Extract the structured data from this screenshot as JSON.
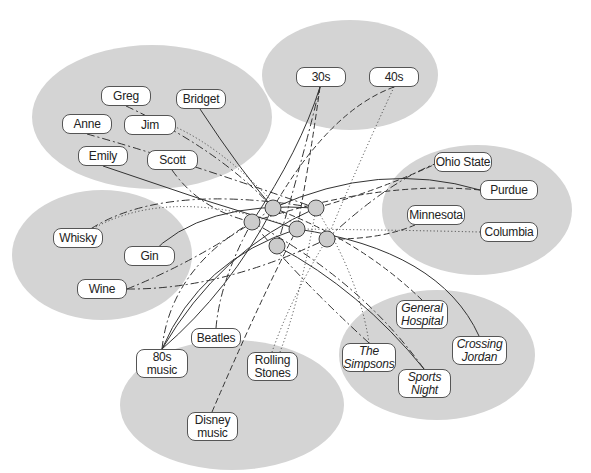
{
  "diagram": {
    "type": "affiliation network",
    "colors": {
      "cluster": "#d4d4d4",
      "node_fill": "#ffffff",
      "node_border": "#555555",
      "hub": "#cccccc",
      "line": "#333333"
    },
    "clusters": [
      {
        "id": "people",
        "cx": 152,
        "cy": 117,
        "rx": 120,
        "ry": 72
      },
      {
        "id": "decades",
        "cx": 350,
        "cy": 75,
        "rx": 88,
        "ry": 55
      },
      {
        "id": "schools",
        "cx": 477,
        "cy": 210,
        "rx": 95,
        "ry": 65
      },
      {
        "id": "drinks",
        "cx": 102,
        "cy": 255,
        "rx": 90,
        "ry": 65
      },
      {
        "id": "tv_shows",
        "cx": 437,
        "cy": 355,
        "rx": 98,
        "ry": 65
      },
      {
        "id": "music",
        "cx": 232,
        "cy": 405,
        "rx": 112,
        "ry": 65
      }
    ],
    "nodes": [
      {
        "id": "greg",
        "label": "Greg",
        "x": 101,
        "y": 86,
        "w": 50,
        "h": 20,
        "italic": false
      },
      {
        "id": "bridget",
        "label": "Bridget",
        "x": 176,
        "y": 89,
        "w": 50,
        "h": 20,
        "italic": false
      },
      {
        "id": "anne",
        "label": "Anne",
        "x": 62,
        "y": 114,
        "w": 50,
        "h": 20,
        "italic": false
      },
      {
        "id": "jim",
        "label": "Jim",
        "x": 124,
        "y": 115,
        "w": 52,
        "h": 20,
        "italic": false
      },
      {
        "id": "emily",
        "label": "Emily",
        "x": 78,
        "y": 146,
        "w": 50,
        "h": 20,
        "italic": false
      },
      {
        "id": "scott",
        "label": "Scott",
        "x": 147,
        "y": 150,
        "w": 51,
        "h": 20,
        "italic": false
      },
      {
        "id": "s30",
        "label": "30s",
        "x": 296,
        "y": 67,
        "w": 50,
        "h": 20,
        "italic": false
      },
      {
        "id": "s40",
        "label": "40s",
        "x": 369,
        "y": 67,
        "w": 50,
        "h": 20,
        "italic": false
      },
      {
        "id": "ohio",
        "label": "Ohio State",
        "x": 434,
        "y": 152,
        "w": 58,
        "h": 20,
        "italic": false
      },
      {
        "id": "purdue",
        "label": "Purdue",
        "x": 480,
        "y": 180,
        "w": 58,
        "h": 20,
        "italic": false
      },
      {
        "id": "minnesota",
        "label": "Minnesota",
        "x": 407,
        "y": 205,
        "w": 58,
        "h": 20,
        "italic": false
      },
      {
        "id": "columbia",
        "label": "Columbia",
        "x": 480,
        "y": 222,
        "w": 58,
        "h": 20,
        "italic": false
      },
      {
        "id": "whisky",
        "label": "Whisky",
        "x": 53,
        "y": 228,
        "w": 50,
        "h": 20,
        "italic": false
      },
      {
        "id": "gin",
        "label": "Gin",
        "x": 124,
        "y": 246,
        "w": 51,
        "h": 20,
        "italic": false
      },
      {
        "id": "wine",
        "label": "Wine",
        "x": 77,
        "y": 279,
        "w": 50,
        "h": 20,
        "italic": false
      },
      {
        "id": "general_hospital",
        "label": "General\nHospital",
        "x": 396,
        "y": 300,
        "w": 52,
        "h": 29,
        "italic": true
      },
      {
        "id": "simpsons",
        "label": "The\nSimpsons",
        "x": 342,
        "y": 343,
        "w": 54,
        "h": 29,
        "italic": true
      },
      {
        "id": "crossing_jordan",
        "label": "Crossing\nJordan",
        "x": 452,
        "y": 336,
        "w": 55,
        "h": 29,
        "italic": true
      },
      {
        "id": "sports_night",
        "label": "Sports\nNight",
        "x": 398,
        "y": 369,
        "w": 53,
        "h": 29,
        "italic": true
      },
      {
        "id": "beatles",
        "label": "Beatles",
        "x": 191,
        "y": 328,
        "w": 50,
        "h": 20,
        "italic": false
      },
      {
        "id": "s80s_music",
        "label": "80s\nmusic",
        "x": 136,
        "y": 349,
        "w": 52,
        "h": 29,
        "italic": false
      },
      {
        "id": "rolling_stones",
        "label": "Rolling\nStones",
        "x": 247,
        "y": 352,
        "w": 51,
        "h": 29,
        "italic": false
      },
      {
        "id": "disney_music",
        "label": "Disney\nmusic",
        "x": 187,
        "y": 412,
        "w": 51,
        "h": 29,
        "italic": false
      }
    ],
    "hubs": [
      {
        "id": "h1",
        "cx": 273,
        "cy": 208,
        "r": 8
      },
      {
        "id": "h2",
        "cx": 316,
        "cy": 208,
        "r": 8
      },
      {
        "id": "h3",
        "cx": 252,
        "cy": 222,
        "r": 8
      },
      {
        "id": "h4",
        "cx": 297,
        "cy": 229,
        "r": 8
      },
      {
        "id": "h5",
        "cx": 327,
        "cy": 239,
        "r": 8
      },
      {
        "id": "h6",
        "cx": 277,
        "cy": 246,
        "r": 8
      }
    ],
    "edges": [
      {
        "d": "M126,106 Q220,150 273,208",
        "style": "dashdot"
      },
      {
        "d": "M200,109 Q240,170 273,208",
        "style": "solid"
      },
      {
        "d": "M171,125 Q230,150 297,229",
        "style": "dotted"
      },
      {
        "d": "M87,134 Q180,160 316,208",
        "style": "dashdot"
      },
      {
        "d": "M103,166 Q200,200 297,229",
        "style": "solid"
      },
      {
        "d": "M172,170 Q200,210 252,222",
        "style": "dashdot"
      },
      {
        "d": "M320,87 Q300,150 252,222",
        "style": "solid"
      },
      {
        "d": "M320,87 Q300,170 277,246",
        "style": "dashdot"
      },
      {
        "d": "M320,87 Q310,160 297,229",
        "style": "dashed"
      },
      {
        "d": "M394,87 Q330,110 273,208",
        "style": "dashed"
      },
      {
        "d": "M394,87 Q360,160 327,239",
        "style": "dotted"
      },
      {
        "d": "M440,162 Q390,180 327,239",
        "style": "dashdot"
      },
      {
        "d": "M440,162 Q380,190 316,208",
        "style": "dashed"
      },
      {
        "d": "M480,190 Q380,160 273,208",
        "style": "solid"
      },
      {
        "d": "M480,190 Q380,180 252,222",
        "style": "dashed"
      },
      {
        "d": "M415,225 Q380,240 327,239",
        "style": "dashed"
      },
      {
        "d": "M480,232 Q400,230 297,229",
        "style": "dotted"
      },
      {
        "d": "M78,238 Q160,180 297,229",
        "style": "dotted"
      },
      {
        "d": "M78,238 Q150,180 316,208",
        "style": "dashdot"
      },
      {
        "d": "M149,256 Q200,200 316,208",
        "style": "solid"
      },
      {
        "d": "M127,289 Q200,260 273,208",
        "style": "dashdot"
      },
      {
        "d": "M127,289 Q220,290 327,239",
        "style": "dashdot"
      },
      {
        "d": "M422,300 Q360,240 273,208",
        "style": "dashed"
      },
      {
        "d": "M369,343 Q300,280 252,222",
        "style": "dashdot"
      },
      {
        "d": "M369,343 Q360,280 316,208",
        "style": "dotted"
      },
      {
        "d": "M479,336 Q440,250 297,229",
        "style": "solid"
      },
      {
        "d": "M424,369 Q360,290 277,246",
        "style": "solid"
      },
      {
        "d": "M424,369 Q360,280 252,222",
        "style": "dashdot"
      },
      {
        "d": "M216,328 Q220,280 252,222",
        "style": "dashdot"
      },
      {
        "d": "M162,349 Q200,260 297,229",
        "style": "solid"
      },
      {
        "d": "M162,349 Q220,250 316,208",
        "style": "solid"
      },
      {
        "d": "M162,349 Q170,270 252,222",
        "style": "dashdot"
      },
      {
        "d": "M162,349 Q230,290 273,208",
        "style": "solid"
      },
      {
        "d": "M272,352 Q290,300 327,239",
        "style": "dotted"
      },
      {
        "d": "M212,412 Q260,300 297,229",
        "style": "dashed"
      },
      {
        "d": "M280,352 Q300,300 316,208",
        "style": "dotted"
      }
    ]
  }
}
